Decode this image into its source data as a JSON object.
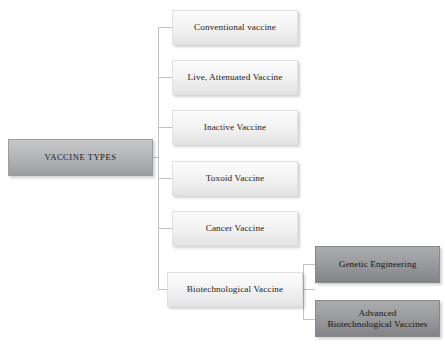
{
  "diagram": {
    "title": "VACCINE TYPES",
    "root": {
      "id": "vaccine-types",
      "label": "VACCINE TYPES",
      "style": "root",
      "x": 8,
      "y": 139,
      "w": 145,
      "h": 37
    },
    "branches": [
      {
        "id": "conventional-vaccine",
        "label": "Conventional vaccine",
        "style": "light",
        "x": 172,
        "y": 10,
        "w": 126,
        "h": 35
      },
      {
        "id": "live-attenuated-vaccine",
        "label": "Live, Attenuated Vaccine",
        "style": "light",
        "x": 172,
        "y": 60,
        "w": 126,
        "h": 35
      },
      {
        "id": "inactive-vaccine",
        "label": "Inactive Vaccine",
        "style": "light",
        "x": 172,
        "y": 110,
        "w": 126,
        "h": 35
      },
      {
        "id": "toxoid-vaccine",
        "label": "Toxoid Vaccine",
        "style": "light",
        "x": 172,
        "y": 161,
        "w": 126,
        "h": 35
      },
      {
        "id": "cancer-vaccine",
        "label": "Cancer Vaccine",
        "style": "light",
        "x": 172,
        "y": 211,
        "w": 126,
        "h": 35
      },
      {
        "id": "biotechnological-vaccine",
        "label": "Biotechnological Vaccine",
        "style": "light",
        "x": 167,
        "y": 272,
        "w": 136,
        "h": 35
      }
    ],
    "sub_branches": [
      {
        "id": "genetic-engineering",
        "label": "Genetic Engineering",
        "style": "dark",
        "x": 315,
        "y": 246,
        "w": 125,
        "h": 37
      },
      {
        "id": "advanced-biotechnological-vaccines",
        "label": "Advanced\nBiotechnological Vaccines",
        "style": "dark",
        "x": 315,
        "y": 300,
        "w": 125,
        "h": 37
      }
    ],
    "connectors": {
      "root_stub": {
        "x": 153,
        "y": 157,
        "w": 6,
        "h": 1,
        "dir": "h"
      },
      "trunk": {
        "x": 158,
        "y": 27,
        "w": 1,
        "h": 263,
        "dir": "v"
      },
      "branch_stubs": [
        {
          "x": 158,
          "y": 27,
          "w": 15,
          "h": 1,
          "dir": "h"
        },
        {
          "x": 158,
          "y": 77,
          "w": 15,
          "h": 1,
          "dir": "h"
        },
        {
          "x": 158,
          "y": 127,
          "w": 15,
          "h": 1,
          "dir": "h"
        },
        {
          "x": 158,
          "y": 178,
          "w": 15,
          "h": 1,
          "dir": "h"
        },
        {
          "x": 158,
          "y": 228,
          "w": 15,
          "h": 1,
          "dir": "h"
        },
        {
          "x": 158,
          "y": 289,
          "w": 10,
          "h": 1,
          "dir": "h"
        }
      ],
      "sub_stub": {
        "x": 303,
        "y": 289,
        "w": 12,
        "h": 1,
        "dir": "h"
      },
      "sub_trunk": {
        "x": 303,
        "y": 264,
        "w": 1,
        "h": 55,
        "dir": "v"
      },
      "sub_branch_stubs": [
        {
          "x": 303,
          "y": 264,
          "w": 12,
          "h": 1,
          "dir": "h"
        },
        {
          "x": 303,
          "y": 319,
          "w": 12,
          "h": 1,
          "dir": "h"
        }
      ]
    }
  }
}
